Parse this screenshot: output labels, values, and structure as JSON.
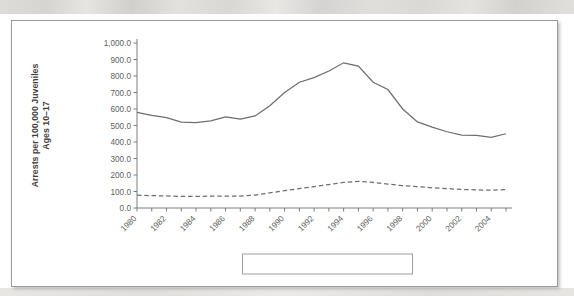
{
  "figure": {
    "frame_visible": true,
    "background_color": "#ffffff",
    "border_color": "#9a9a9a"
  },
  "chart_data": {
    "type": "line",
    "title": "",
    "subtitle": "",
    "xlabel": "",
    "ylabel": "Arrests per 100,000 Juveniles Ages 10–17",
    "ylabel_lines": [
      "Arrests per 100,000 Juveniles",
      "Ages 10–17"
    ],
    "grid": false,
    "legend_position": "bottom-center",
    "xlim": [
      1980,
      2005
    ],
    "ylim": [
      0,
      1000
    ],
    "ytick_step": 100,
    "ytick_labels": [
      "0.0",
      "100.0",
      "200.0",
      "300.0",
      "400.0",
      "500.0",
      "600.0",
      "700.0",
      "800.0",
      "900.0",
      "1,000.0"
    ],
    "ytick_values": [
      0,
      100,
      200,
      300,
      400,
      500,
      600,
      700,
      800,
      900,
      1000
    ],
    "xtick_labels": [
      "1980",
      "1982",
      "1984",
      "1986",
      "1988",
      "1990",
      "1992",
      "1994",
      "1996",
      "1998",
      "2000",
      "2002",
      "2004"
    ],
    "xtick_values": [
      1980,
      1982,
      1984,
      1986,
      1988,
      1990,
      1992,
      1994,
      1996,
      1998,
      2000,
      2002,
      2004
    ],
    "xtick_label_rotation": -45,
    "x": [
      1980,
      1981,
      1982,
      1983,
      1984,
      1985,
      1986,
      1987,
      1988,
      1989,
      1990,
      1991,
      1992,
      1993,
      1994,
      1995,
      1996,
      1997,
      1998,
      1999,
      2000,
      2001,
      2002,
      2003,
      2004,
      2005
    ],
    "series": [
      {
        "name": "Male",
        "style": "solid",
        "color": "#6e6e6e",
        "values": [
          580,
          562,
          548,
          520,
          518,
          528,
          552,
          538,
          558,
          620,
          700,
          762,
          790,
          830,
          880,
          860,
          762,
          718,
          600,
          522,
          490,
          462,
          442,
          440,
          428,
          450
        ]
      },
      {
        "name": "Female",
        "style": "dashed",
        "color": "#6e6e6e",
        "values": [
          78,
          75,
          73,
          70,
          70,
          72,
          72,
          72,
          78,
          92,
          105,
          118,
          130,
          142,
          155,
          162,
          155,
          145,
          135,
          130,
          122,
          118,
          112,
          110,
          108,
          112
        ]
      }
    ]
  },
  "legend": {
    "items": [
      {
        "label": "Male",
        "style": "solid"
      },
      {
        "label": "Female",
        "style": "dashed"
      }
    ]
  }
}
